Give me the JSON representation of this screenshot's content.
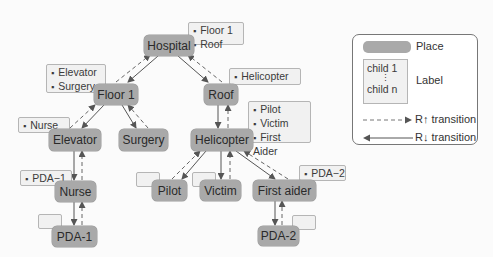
{
  "diagram": {
    "places": [
      {
        "id": "hospital",
        "label": "Hospital"
      },
      {
        "id": "floor1",
        "label": "Floor 1"
      },
      {
        "id": "roof",
        "label": "Roof"
      },
      {
        "id": "elevator",
        "label": "Elevator"
      },
      {
        "id": "surgery",
        "label": "Surgery"
      },
      {
        "id": "helicopter",
        "label": "Helicopter"
      },
      {
        "id": "nurse",
        "label": "Nurse"
      },
      {
        "id": "pilot",
        "label": "Pilot"
      },
      {
        "id": "victim",
        "label": "Victim"
      },
      {
        "id": "firstaider",
        "label": "First aider"
      },
      {
        "id": "pda1",
        "label": "PDA-1"
      },
      {
        "id": "pda2",
        "label": "PDA-2"
      }
    ],
    "labels": {
      "hospital": [
        "Floor 1",
        "Roof"
      ],
      "floor1": [
        "Elevator",
        "Surgery"
      ],
      "roof": [
        "Helicopter"
      ],
      "elevator": [
        "Nurse"
      ],
      "helicopter": [
        "Pilot",
        "Victim",
        "First Aider"
      ],
      "nurse": [
        "PDA−1"
      ],
      "firstaider": [
        "PDA−2"
      ],
      "pilot": [],
      "victim": [],
      "pda1": [],
      "pda2": []
    },
    "edges": [
      [
        "hospital",
        "floor1"
      ],
      [
        "hospital",
        "roof"
      ],
      [
        "floor1",
        "elevator"
      ],
      [
        "floor1",
        "surgery"
      ],
      [
        "roof",
        "helicopter"
      ],
      [
        "elevator",
        "nurse"
      ],
      [
        "nurse",
        "pda1"
      ],
      [
        "helicopter",
        "pilot"
      ],
      [
        "helicopter",
        "victim"
      ],
      [
        "helicopter",
        "firstaider"
      ],
      [
        "firstaider",
        "pda2"
      ]
    ]
  },
  "legend": {
    "place": "Place",
    "label": "Label",
    "child_first": "child 1",
    "child_dots": "⋮",
    "child_last": "child n",
    "r_up": "R↑ transition",
    "r_down": "R↓ transition"
  },
  "colors": {
    "node": "#a9a9a9",
    "label_bg": "#f1f1f1",
    "edge": "#555555"
  }
}
